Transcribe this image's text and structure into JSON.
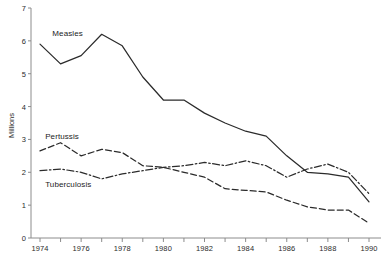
{
  "chart_data": {
    "type": "line",
    "title": "",
    "xlabel": "",
    "ylabel": "Millions",
    "xlim": [
      1974,
      1990
    ],
    "ylim": [
      0,
      7
    ],
    "grid": false,
    "legend_position": "inline-annotations",
    "x": [
      1974,
      1975,
      1976,
      1977,
      1978,
      1979,
      1980,
      1981,
      1982,
      1983,
      1984,
      1985,
      1986,
      1987,
      1988,
      1989,
      1990
    ],
    "xticks": [
      1974,
      1975,
      1976,
      1977,
      1978,
      1979,
      1980,
      1981,
      1982,
      1983,
      1984,
      1985,
      1986,
      1987,
      1988,
      1989,
      1990
    ],
    "xtick_labels": [
      "1974",
      "",
      "1976",
      "",
      "1978",
      "",
      "1980",
      "",
      "1982",
      "",
      "1984",
      "",
      "1986",
      "",
      "1988",
      "",
      "1990"
    ],
    "yticks": [
      0,
      1,
      2,
      3,
      4,
      5,
      6,
      7
    ],
    "ytick_labels": [
      "0",
      "1",
      "2",
      "3",
      "4",
      "5",
      "6",
      "7"
    ],
    "series": [
      {
        "name": "Measles",
        "style": "solid",
        "color": "#2b2b2b",
        "label_x": 1974.6,
        "label_y": 6.22,
        "values": [
          5.9,
          5.3,
          5.55,
          6.2,
          5.85,
          4.9,
          4.2,
          4.2,
          3.8,
          3.5,
          3.25,
          3.1,
          2.5,
          2.0,
          1.95,
          1.85,
          1.1
        ]
      },
      {
        "name": "Pertussis",
        "style": "dashed",
        "color": "#2b2b2b",
        "label_x": 1974.25,
        "label_y": 3.08,
        "values": [
          2.65,
          2.9,
          2.5,
          2.7,
          2.6,
          2.2,
          2.15,
          2.0,
          1.85,
          1.5,
          1.45,
          1.4,
          1.15,
          0.95,
          0.85,
          0.85,
          0.45
        ]
      },
      {
        "name": "Tuberculosis",
        "style": "dash-dot",
        "color": "#2b2b2b",
        "label_x": 1974.25,
        "label_y": 1.62,
        "values": [
          2.05,
          2.1,
          2.0,
          1.8,
          1.95,
          2.05,
          2.15,
          2.2,
          2.3,
          2.2,
          2.35,
          2.2,
          1.85,
          2.1,
          2.25,
          2.0,
          1.35
        ]
      }
    ]
  },
  "source_note": ""
}
